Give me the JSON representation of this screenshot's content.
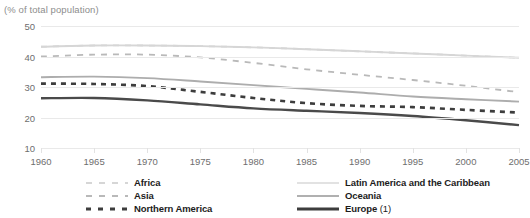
{
  "subtitle": "(% of total population)",
  "chart_data": {
    "type": "line",
    "title": "",
    "subtitle": "(% of total population)",
    "xlabel": "",
    "ylabel": "",
    "x": [
      1960,
      1965,
      1970,
      1975,
      1980,
      1985,
      1990,
      1995,
      2000,
      2005
    ],
    "xlim": [
      1960,
      2005
    ],
    "ylim": [
      10,
      50
    ],
    "yticks": [
      10,
      20,
      30,
      40,
      50
    ],
    "xticks": [
      "1960",
      "1965",
      "1970",
      "1975",
      "1980",
      "1985",
      "1990",
      "1995",
      "2000",
      "2005"
    ],
    "grid": true,
    "legend_position": "bottom",
    "series": [
      {
        "name": "Africa",
        "style": "dashed",
        "color": "#d6d6d6",
        "values": [
          43.2,
          43.6,
          43.6,
          43.4,
          43.0,
          42.4,
          41.7,
          41.0,
          40.3,
          39.6
        ]
      },
      {
        "name": "Asia",
        "style": "dashed",
        "color": "#b9b9b9",
        "values": [
          40.0,
          40.6,
          40.6,
          39.7,
          37.9,
          35.8,
          34.0,
          32.3,
          30.4,
          28.3
        ]
      },
      {
        "name": "Northern America",
        "style": "dashed",
        "color": "#3d3d3d",
        "values": [
          31.1,
          31.0,
          30.3,
          28.4,
          26.4,
          24.7,
          23.8,
          23.4,
          22.5,
          21.6
        ]
      },
      {
        "name": "Latin America and the Caribbean",
        "style": "solid",
        "color": "#d6d6d6",
        "values": [
          43.2,
          43.6,
          43.6,
          43.4,
          43.0,
          42.4,
          41.7,
          41.0,
          40.3,
          39.6
        ]
      },
      {
        "name": "Oceania",
        "style": "solid",
        "color": "#adadad",
        "values": [
          33.2,
          33.4,
          32.9,
          31.8,
          30.6,
          29.4,
          28.2,
          26.9,
          26.0,
          25.2
        ]
      },
      {
        "name": "Europe (1)",
        "style": "solid",
        "color": "#4a4a4a",
        "values": [
          26.3,
          26.4,
          25.6,
          24.3,
          23.0,
          22.2,
          21.5,
          20.5,
          19.1,
          17.5
        ]
      }
    ]
  },
  "legend": {
    "left": [
      {
        "label": "Africa",
        "style": "dashed",
        "color": "#d6d6d6"
      },
      {
        "label": "Asia",
        "style": "dashed",
        "color": "#b9b9b9"
      },
      {
        "label": "Northern America",
        "style": "dashed",
        "color": "#3d3d3d"
      }
    ],
    "right": [
      {
        "label": "Latin America and the Caribbean",
        "style": "solid",
        "color": "#e2e2e2"
      },
      {
        "label": "Oceania",
        "style": "solid",
        "color": "#b0b0b0"
      },
      {
        "label": "Europe (1)",
        "style": "solid",
        "color": "#3d3d3d"
      }
    ]
  }
}
